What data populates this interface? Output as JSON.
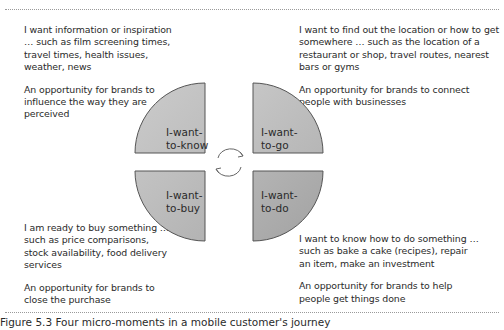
{
  "quadrants": {
    "know": {
      "label_line1": "I-want-",
      "label_line2": "to-know",
      "description": "I want information or inspiration … such as film screening times, travel times, health issues, weather, news",
      "opportunity": "An opportunity for brands to influence the way they are perceived"
    },
    "go": {
      "label_line1": "I-want-",
      "label_line2": "to-go",
      "description": "I want to find out the location or how to get somewhere … such as the location of a restaurant or shop,  travel routes, nearest bars or gyms",
      "opportunity": "An opportunity for brands to connect people with businesses"
    },
    "buy": {
      "label_line1": "I-want-",
      "label_line2": "to-buy",
      "description": "I am ready to buy something … such as price comparisons, stock availability, food delivery services",
      "opportunity": "An opportunity for brands to close the purchase"
    },
    "do": {
      "label_line1": "I-want-",
      "label_line2": "to-do",
      "description": "I want to know how to do something … such as bake a cake (recipes), repair an item, make an investment",
      "opportunity": "An opportunity for brands to help people get things done"
    }
  },
  "center_icon": "cycle-arrows-icon",
  "caption": "Figure 5.3  Four micro-moments in a mobile customer's journey",
  "colors": {
    "quadrant_fill_light": "#c4c4c4",
    "quadrant_fill_dark": "#adadad",
    "outline": "#555555",
    "text": "#2a2a2a"
  }
}
